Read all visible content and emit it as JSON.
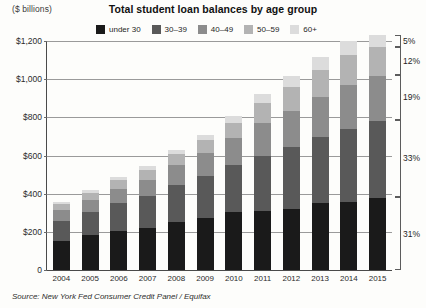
{
  "header": {
    "units_label": "($ billions)",
    "title": "Total student loan balances by age group"
  },
  "source": {
    "text": "Source: New York Fed Consumer Credit Panel / Equifax"
  },
  "chart_data": {
    "type": "bar",
    "variant": "stacked-vertical",
    "title": "Total student loan balances by age group",
    "xlabel": "",
    "ylabel": "($ billions)",
    "ylim": [
      0,
      1200
    ],
    "yticks": [
      0,
      200,
      400,
      600,
      800,
      1000,
      1200
    ],
    "ytick_labels": [
      "0",
      "$200",
      "$400",
      "$600",
      "$800",
      "$1,000",
      "$1,200"
    ],
    "grid": true,
    "legend_position": "top-center",
    "categories": [
      "2004",
      "2005",
      "2006",
      "2007",
      "2008",
      "2009",
      "2010",
      "2011",
      "2012",
      "2013",
      "2014",
      "2015"
    ],
    "series": [
      {
        "name": "under 30",
        "color": "#1a1a1a",
        "values": [
          150,
          183,
          203,
          222,
          249,
          272,
          302,
          310,
          322,
          352,
          357,
          376
        ]
      },
      {
        "name": "30-39",
        "color": "#595959",
        "values": [
          107,
          122,
          148,
          167,
          196,
          219,
          250,
          290,
          322,
          345,
          383,
          404
        ]
      },
      {
        "name": "40-49",
        "color": "#8c8c8c",
        "values": [
          58,
          62,
          76,
          85,
          104,
          120,
          139,
          168,
          192,
          208,
          228,
          236
        ]
      },
      {
        "name": "50-59",
        "color": "#b3b3b3",
        "values": [
          30,
          36,
          43,
          49,
          58,
          68,
          80,
          105,
          125,
          142,
          158,
          153
        ]
      },
      {
        "name": "60+",
        "color": "#dcdcdc",
        "values": [
          12,
          14,
          17,
          20,
          24,
          29,
          35,
          47,
          58,
          67,
          74,
          62
        ]
      }
    ],
    "totals": [
      357,
      417,
      487,
      543,
      631,
      708,
      806,
      920,
      1019,
      1114,
      1200,
      1231
    ],
    "annotations": [
      {
        "label": "5%",
        "series": "60+",
        "range_pct": [
          95,
          100
        ]
      },
      {
        "label": "12%",
        "series": "50-59",
        "range_pct": [
          83,
          95
        ]
      },
      {
        "label": "19%",
        "series": "40-49",
        "range_pct": [
          64,
          83
        ]
      },
      {
        "label": "33%",
        "series": "30-39",
        "range_pct": [
          31,
          64
        ]
      },
      {
        "label": "31%",
        "series": "under 30",
        "range_pct": [
          0,
          31
        ]
      }
    ]
  }
}
